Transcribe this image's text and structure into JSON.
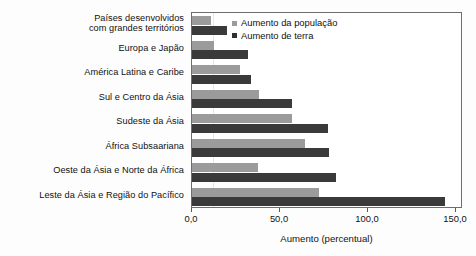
{
  "chart_data": {
    "type": "bar",
    "orientation": "horizontal",
    "title": "",
    "xlabel": "Aumento (percentual)",
    "ylabel": "",
    "xlim": [
      0,
      150
    ],
    "xticks": [
      0,
      50,
      100,
      150
    ],
    "xtick_labels": [
      "0,0",
      "50,0",
      "100,0",
      "150,0"
    ],
    "grid": false,
    "legend_position": "top-right",
    "categories": [
      "Países desenvolvidos\ncom grandes territórios",
      "Europa e Japão",
      "América Latina e Caribe",
      "Sul e Centro da Ásia",
      "Sudeste da Ásia",
      "África Subsaariana",
      "Oeste da Ásia e Norte da África",
      "Leste da Ásia e Região do Pacífico"
    ],
    "series": [
      {
        "name": "Aumento da população",
        "color": "#9b9b9b",
        "values": [
          11.0,
          12.5,
          27.0,
          38.0,
          57.0,
          64.0,
          37.5,
          72.0
        ]
      },
      {
        "name": "Aumento de terra",
        "color": "#3a3a3a",
        "values": [
          20.0,
          32.0,
          33.5,
          57.0,
          77.0,
          78.0,
          82.0,
          144.0
        ]
      }
    ]
  },
  "category_labels": [
    {
      "line1": "Países desenvolvidos",
      "line2": "com grandes territórios"
    },
    {
      "line1": "Europa e Japão",
      "line2": ""
    },
    {
      "line1": "América Latina e Caribe",
      "line2": ""
    },
    {
      "line1": "Sul e Centro da Ásia",
      "line2": ""
    },
    {
      "line1": "Sudeste da Ásia",
      "line2": ""
    },
    {
      "line1": "África Subsaariana",
      "line2": ""
    },
    {
      "line1": "Oeste da Ásia e Norte da África",
      "line2": ""
    },
    {
      "line1": "Leste da Ásia e Região do Pacífico",
      "line2": ""
    }
  ],
  "legend": {
    "items": [
      {
        "label": "Aumento da população",
        "color": "#9b9b9b"
      },
      {
        "label": "Aumento de terra",
        "color": "#2f2f2f"
      }
    ]
  },
  "axis": {
    "x_title": "Aumento (percentual)",
    "tick_labels": [
      "0,0",
      "50,0",
      "100,0",
      "150,0"
    ]
  }
}
